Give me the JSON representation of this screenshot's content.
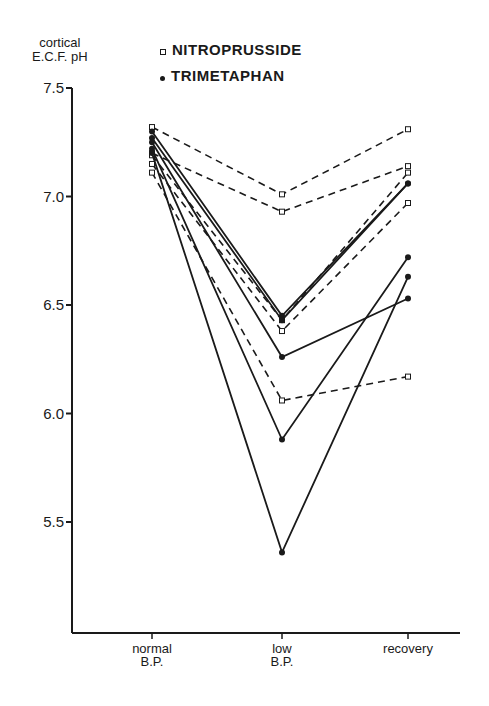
{
  "chart_data": {
    "type": "line",
    "title": "",
    "ylabel": "cortical E.C.F. pH",
    "ylabel_lines": [
      "cortical",
      "E.C.F. pH"
    ],
    "xlabel": "",
    "categories": [
      "normal B.P.",
      "low B.P.",
      "recovery"
    ],
    "category_lines": [
      [
        "normal",
        "B.P."
      ],
      [
        "low",
        "B.P."
      ],
      [
        "recovery"
      ]
    ],
    "ylim": [
      5.0,
      7.5
    ],
    "yticks": [
      7.5,
      7.0,
      6.5,
      6.0,
      5.5
    ],
    "ytick_labels": [
      "7.5",
      "7.0",
      "6.5",
      "6.0",
      "5.5"
    ],
    "grid": false,
    "legend_position": "top",
    "legend": [
      {
        "name": "NITROPRUSSIDE",
        "marker": "open-square",
        "line": "dashed"
      },
      {
        "name": "TRIMETAPHAN",
        "marker": "filled-circle",
        "line": "solid"
      }
    ],
    "series": [
      {
        "name": "NITROPRUSSIDE 1",
        "group": "NITROPRUSSIDE",
        "values": [
          7.32,
          7.01,
          7.31
        ]
      },
      {
        "name": "NITROPRUSSIDE 2",
        "group": "NITROPRUSSIDE",
        "values": [
          7.2,
          6.93,
          7.14
        ]
      },
      {
        "name": "NITROPRUSSIDE 3",
        "group": "NITROPRUSSIDE",
        "values": [
          7.19,
          6.43,
          7.11
        ]
      },
      {
        "name": "NITROPRUSSIDE 4",
        "group": "NITROPRUSSIDE",
        "values": [
          7.15,
          6.38,
          6.97
        ]
      },
      {
        "name": "NITROPRUSSIDE 5",
        "group": "NITROPRUSSIDE",
        "values": [
          7.11,
          6.06,
          6.17
        ]
      },
      {
        "name": "TRIMETAPHAN 1",
        "group": "TRIMETAPHAN",
        "values": [
          7.3,
          6.45,
          7.06
        ]
      },
      {
        "name": "TRIMETAPHAN 2",
        "group": "TRIMETAPHAN",
        "values": [
          7.27,
          6.43,
          7.06
        ]
      },
      {
        "name": "TRIMETAPHAN 3",
        "group": "TRIMETAPHAN",
        "values": [
          7.25,
          6.26,
          6.53
        ]
      },
      {
        "name": "TRIMETAPHAN 4",
        "group": "TRIMETAPHAN",
        "values": [
          7.22,
          5.88,
          6.72
        ]
      },
      {
        "name": "TRIMETAPHAN 5",
        "group": "TRIMETAPHAN",
        "values": [
          7.2,
          5.36,
          6.63
        ]
      }
    ]
  },
  "colors": {
    "ink": "#1a1a1a",
    "background": "#ffffff"
  }
}
